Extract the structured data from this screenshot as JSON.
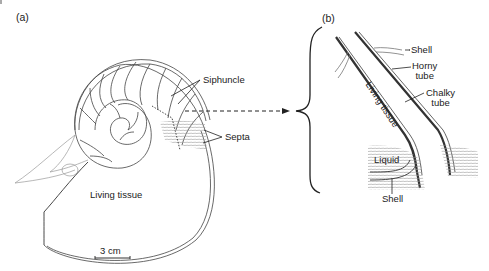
{
  "figure": {
    "panel_a": {
      "label": "(a)",
      "annotations": {
        "siphuncle": "Siphuncle",
        "septa": "Septa",
        "living_tissue": "Living tissue",
        "scale_bar": "3 cm"
      },
      "chamber_numbers": [
        "1",
        "2",
        "3",
        "4",
        "5",
        "6"
      ]
    },
    "panel_b": {
      "label": "(b)",
      "annotations": {
        "shell_top": "Shell",
        "horny_tube_line1": "Horny",
        "horny_tube_line2": "tube",
        "chalky_tube_line1": "Chalky",
        "chalky_tube_line2": "tube",
        "living_tissue": "Living tissue",
        "liquid": "Liquid",
        "shell_bottom": "Shell"
      }
    },
    "colors": {
      "line": "#333333",
      "hatch": "#9a9a9a",
      "background": "#ffffff"
    }
  }
}
